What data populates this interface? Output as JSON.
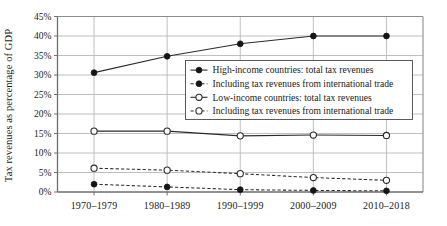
{
  "chart_data": {
    "type": "line",
    "title": "",
    "xlabel": "",
    "ylabel": "Tax revenues as percentage of GDP",
    "categories": [
      "1970–1979",
      "1980–1989",
      "1990–1999",
      "2000–2009",
      "2010–2018"
    ],
    "ylim": [
      0,
      45
    ],
    "ytick_labels": [
      "0%",
      "5%",
      "10%",
      "15%",
      "20%",
      "25%",
      "30%",
      "35%",
      "40%",
      "45%"
    ],
    "ytick_values": [
      0,
      5,
      10,
      15,
      20,
      25,
      30,
      35,
      40,
      45
    ],
    "grid": true,
    "legend_position": "upper-center-right",
    "series": [
      {
        "name": "High-income countries: total tax revenues",
        "marker": "filled-circle",
        "line": "solid",
        "values": [
          30.6,
          34.8,
          38.0,
          40.0,
          40.0
        ]
      },
      {
        "name": "Including tax revenues from international trade",
        "marker": "filled-circle",
        "line": "dashed",
        "values": [
          2.0,
          1.3,
          0.6,
          0.4,
          0.3
        ]
      },
      {
        "name": "Low-income countries: total tax revenues",
        "marker": "open-circle",
        "line": "solid",
        "values": [
          15.6,
          15.6,
          14.4,
          14.6,
          14.5
        ]
      },
      {
        "name": "Including tax revenues from international trade",
        "marker": "open-circle",
        "line": "dashed",
        "values": [
          6.1,
          5.6,
          4.7,
          3.7,
          3.0
        ]
      }
    ]
  },
  "legend": {
    "items": [
      "High-income countries: total tax revenues",
      "Including tax revenues from international trade",
      "Low-income countries: total tax revenues",
      "Including tax revenues from international trade"
    ]
  },
  "colors": {
    "ink": "#1b1b1b",
    "grid": "#b9b9b9",
    "axis": "#6e6e6e",
    "background": "#ffffff"
  }
}
